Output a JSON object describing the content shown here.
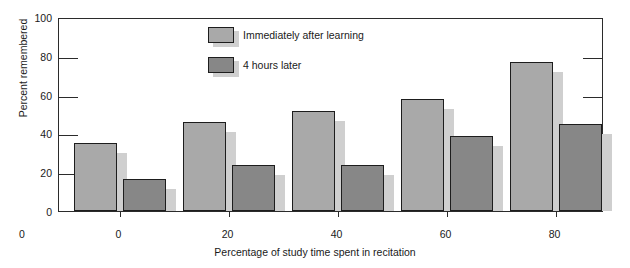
{
  "chart_data": {
    "type": "bar",
    "title": "",
    "xlabel": "Percentage of study time spent in recitation",
    "ylabel": "Percent remembered",
    "categories": [
      "0",
      "20",
      "40",
      "60",
      "80"
    ],
    "xticklabels": [
      "0",
      "20",
      "40",
      "60",
      "80"
    ],
    "yticklabels": [
      "0",
      "20",
      "40",
      "60",
      "80",
      "100"
    ],
    "yticks": [
      0,
      20,
      40,
      60,
      80,
      100
    ],
    "ylim": [
      0,
      100
    ],
    "grid": false,
    "legend_position": "upper-center-left",
    "origin_label": "0",
    "series": [
      {
        "name": "Immediately after learning",
        "color": "#a9a9a9",
        "values": [
          35,
          46,
          51.5,
          57.5,
          77
        ]
      },
      {
        "name": "4 hours later",
        "color": "#878787",
        "values": [
          16.5,
          23.5,
          23.5,
          38.5,
          45
        ]
      }
    ]
  },
  "legend": {
    "items": [
      {
        "label": "Immediately after learning",
        "swatch": "light"
      },
      {
        "label": "4 hours later",
        "swatch": "dark"
      }
    ]
  },
  "colors": {
    "series_light": "#a9a9a9",
    "series_dark": "#878787",
    "shadow": "#cfcfcf",
    "axis": "#2b2b2b",
    "text": "#1a1a1a",
    "background": "#ffffff"
  }
}
